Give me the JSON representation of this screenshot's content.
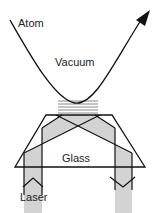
{
  "diagram": {
    "labels": {
      "atom": "Atom",
      "vacuum": "Vacuum",
      "glass": "Glass",
      "laser": "Laser"
    },
    "colors": {
      "stroke": "#111111",
      "beam_fill": "#d3d3d3",
      "mirror_lines": "#888888"
    }
  }
}
